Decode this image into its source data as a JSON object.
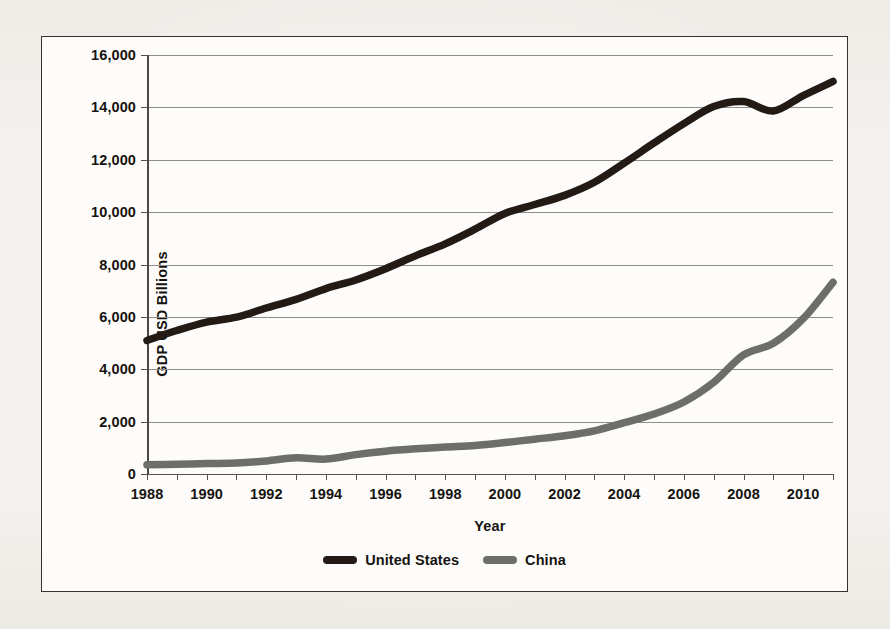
{
  "chart_data": {
    "type": "line",
    "title": "",
    "xlabel": "Year",
    "ylabel": "GDP USD Billions",
    "xlim": [
      1988,
      2011
    ],
    "ylim": [
      0,
      16000
    ],
    "grid": true,
    "legend_position": "bottom-center",
    "y_ticks": [
      0,
      2000,
      4000,
      6000,
      8000,
      10000,
      12000,
      14000,
      16000
    ],
    "y_tick_labels": [
      "0",
      "2,000",
      "4,000",
      "6,000",
      "8,000",
      "10,000",
      "12,000",
      "14,000",
      "16,000"
    ],
    "x_ticks": [
      1988,
      1989,
      1990,
      1991,
      1992,
      1993,
      1994,
      1995,
      1996,
      1997,
      1998,
      1999,
      2000,
      2001,
      2002,
      2003,
      2004,
      2005,
      2006,
      2007,
      2008,
      2009,
      2010,
      2011
    ],
    "x_tick_labels_shown": [
      "1988",
      "1990",
      "1992",
      "1994",
      "1996",
      "1998",
      "2000",
      "2002",
      "2004",
      "2006",
      "2008",
      "2010"
    ],
    "x": [
      1988,
      1989,
      1990,
      1991,
      1992,
      1993,
      1994,
      1995,
      1996,
      1997,
      1998,
      1999,
      2000,
      2001,
      2002,
      2003,
      2004,
      2005,
      2006,
      2007,
      2008,
      2009,
      2010,
      2011
    ],
    "series": [
      {
        "name": "United States",
        "color": "#241a15",
        "values": [
          5100,
          5480,
          5800,
          5990,
          6340,
          6670,
          7080,
          7410,
          7840,
          8330,
          8790,
          9350,
          9950,
          10290,
          10640,
          11140,
          11870,
          12640,
          13380,
          14030,
          14220,
          13860,
          14450,
          14990
        ]
      },
      {
        "name": "China",
        "color": "#6d6d69",
        "values": [
          350,
          370,
          400,
          420,
          500,
          620,
          570,
          740,
          870,
          960,
          1030,
          1090,
          1200,
          1330,
          1460,
          1650,
          1960,
          2290,
          2750,
          3500,
          4550,
          4990,
          5930,
          7320
        ]
      }
    ]
  },
  "legend": {
    "items": [
      {
        "label": "United States",
        "color": "#241a15"
      },
      {
        "label": "China",
        "color": "#6d6d69"
      }
    ]
  }
}
